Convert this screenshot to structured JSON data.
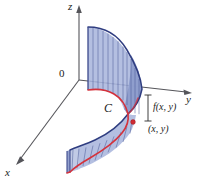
{
  "figure": {
    "background_color": "#ffffff",
    "width": 199,
    "height": 189
  },
  "axes": {
    "z_label": "z",
    "y_label": "y",
    "x_label": "x",
    "origin_label": "0",
    "axis_color": "#55555a",
    "hidden_axis_color": "#3a3f7a"
  },
  "annotations": {
    "curve_label": "C",
    "height_label": "f(x, y)",
    "point_label": "(x, y)"
  },
  "colors": {
    "surface_fill": "#aab6dd",
    "surface_fill_dark": "#8d9ccb",
    "surface_fill_light": "#c2cbe6",
    "ruling_line": "#4a5896",
    "top_edge": "#2f3d80",
    "curve_red": "#d4323c",
    "marker_dot": "#cf2b33",
    "label_text": "#1c1c1c"
  },
  "icons": {
    "z_arrow": "arrow-up-icon",
    "y_arrow": "arrow-right-icon",
    "x_arrow": "arrow-down-left-icon",
    "point_marker": "point-dot-icon",
    "height_bracket": "bracket-icon"
  }
}
